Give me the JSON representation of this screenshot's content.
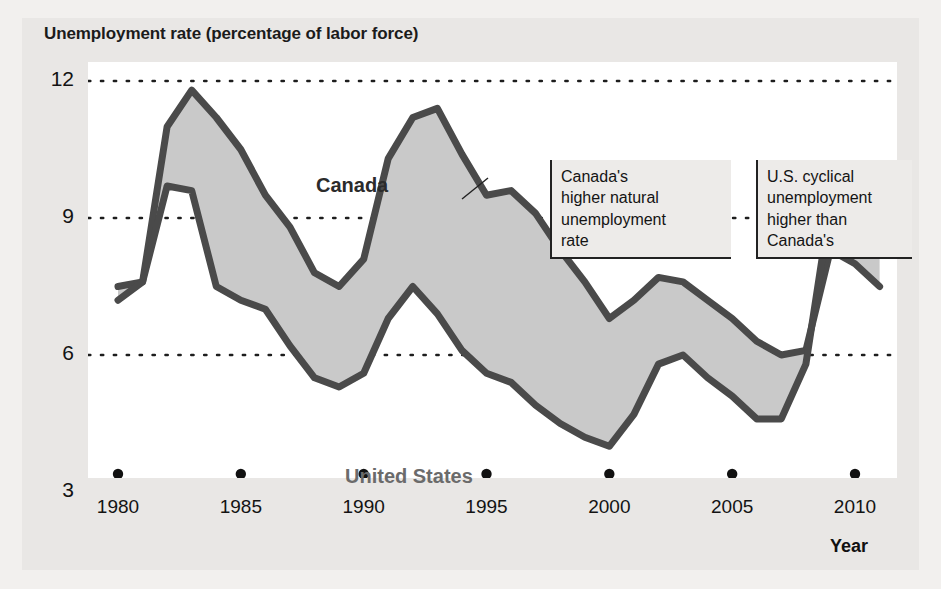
{
  "chart_data": {
    "type": "line",
    "title": "Unemployment rate (percentage of labor force)",
    "xlabel": "Year",
    "ylabel": "Unemployment rate (percentage of labor force)",
    "xlim": [
      1980,
      2011
    ],
    "ylim": [
      3,
      12
    ],
    "yticks": [
      "12",
      "9",
      "6",
      "3"
    ],
    "ytick_values": [
      12,
      9,
      6,
      3
    ],
    "xticks": [
      "1980",
      "1985",
      "1990",
      "1995",
      "2000",
      "2005",
      "2010"
    ],
    "xtick_values": [
      1980,
      1985,
      1990,
      1995,
      2000,
      2005,
      2010
    ],
    "grid": "horizontal-dotted",
    "legend": "inline-labels",
    "fill_between": true,
    "x": [
      1980,
      1981,
      1982,
      1983,
      1984,
      1985,
      1986,
      1987,
      1988,
      1989,
      1990,
      1991,
      1992,
      1993,
      1994,
      1995,
      1996,
      1997,
      1998,
      1999,
      2000,
      2001,
      2002,
      2003,
      2004,
      2005,
      2006,
      2007,
      2008,
      2009,
      2010,
      2011
    ],
    "series": [
      {
        "name": "Canada",
        "color": "#4a4a4a",
        "values": [
          7.5,
          7.6,
          11.0,
          11.8,
          11.2,
          10.5,
          9.5,
          8.8,
          7.8,
          7.5,
          8.1,
          10.3,
          11.2,
          11.4,
          10.4,
          9.5,
          9.6,
          9.1,
          8.3,
          7.6,
          6.8,
          7.2,
          7.7,
          7.6,
          7.2,
          6.8,
          6.3,
          6.0,
          6.1,
          8.3,
          8.0,
          7.5
        ],
        "peak": {
          "year": 1983,
          "value": 11.8
        }
      },
      {
        "name": "United States",
        "color": "#4a4a4a",
        "values": [
          7.2,
          7.6,
          9.7,
          9.6,
          7.5,
          7.2,
          7.0,
          6.2,
          5.5,
          5.3,
          5.6,
          6.8,
          7.5,
          6.9,
          6.1,
          5.6,
          5.4,
          4.9,
          4.5,
          4.2,
          4.0,
          4.7,
          5.8,
          6.0,
          5.5,
          5.1,
          4.6,
          4.6,
          5.8,
          9.3,
          9.6,
          8.9
        ],
        "peak": {
          "year": 2010,
          "value": 9.6
        }
      }
    ],
    "annotations": [
      {
        "id": "canada-natural-rate",
        "text": "Canada's higher natural unemployment rate",
        "lines": [
          "Canada's",
          "higher natural",
          "unemployment",
          "rate"
        ],
        "points_to": "canada-series-1993"
      },
      {
        "id": "us-cyclical",
        "text": "U.S. cyclical unemployment higher than Canada's",
        "lines": [
          "U.S. cyclical",
          "unemployment",
          "higher than",
          "Canada's"
        ],
        "points_to": "us-series-2009"
      }
    ],
    "colors": {
      "canada_line": "#4a4a4a",
      "us_line": "#4a4a4a",
      "band_fill": "#c9c9c9",
      "plot_background": "#ffffff",
      "card_background": "#e9e7e5",
      "page_background": "#f2f0ee",
      "gridline": "#1d1d1d",
      "text": "#131313"
    }
  }
}
